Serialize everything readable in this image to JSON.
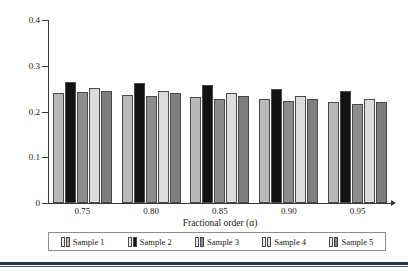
{
  "figure": {
    "background": "#ffffff"
  },
  "chart_data": {
    "type": "bar",
    "title": "",
    "xlabel": "Fractional order (α)",
    "ylabel": "Mean absolute error (MAE)",
    "categories": [
      "0.75",
      "0.80",
      "0.85",
      "0.90",
      "0.95"
    ],
    "ylim": [
      0,
      0.4
    ],
    "yticks": [
      "0",
      "0.1",
      "0.2",
      "0.3",
      "0.4"
    ],
    "ytick_values": [
      0,
      0.1,
      0.2,
      0.3,
      0.4
    ],
    "grid": false,
    "legend_position": "bottom",
    "series": [
      {
        "name": "Sample 1",
        "color": "#b9b9b9",
        "values": [
          0.241,
          0.236,
          0.231,
          0.227,
          0.221
        ]
      },
      {
        "name": "Sample 2",
        "color": "#121212",
        "values": [
          0.264,
          0.262,
          0.257,
          0.25,
          0.244
        ]
      },
      {
        "name": "Sample 3",
        "color": "#8c8c8c",
        "values": [
          0.242,
          0.235,
          0.227,
          0.222,
          0.216
        ]
      },
      {
        "name": "Sample 4",
        "color": "#dcdcdc",
        "values": [
          0.252,
          0.245,
          0.24,
          0.233,
          0.227
        ]
      },
      {
        "name": "Sample 5",
        "color": "#7e7e7e",
        "values": [
          0.244,
          0.24,
          0.233,
          0.228,
          0.221
        ]
      }
    ]
  },
  "axis": {
    "line_color": "#3a3a3a"
  }
}
